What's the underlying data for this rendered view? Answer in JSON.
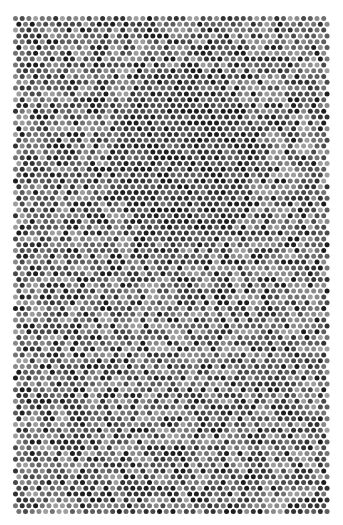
{
  "artwork": {
    "description": "Halftone dot pattern in grayscale on white background",
    "background": "#ffffff",
    "pattern_area": {
      "x": 13,
      "y": 16,
      "width": 318,
      "height": 500
    },
    "dot": {
      "pitch_x": 6.7,
      "pitch_y": 5.8,
      "radius": 2.5,
      "row_offset": 3.35
    },
    "gray_levels": [
      "#1e1e1e",
      "#333333",
      "#4a4a4a",
      "#5e5e5e",
      "#747474",
      "#8a8a8a",
      "#9e9e9e"
    ],
    "dark_region": {
      "cx": 185,
      "cy": 160,
      "rx": 70,
      "ry": 90
    }
  }
}
